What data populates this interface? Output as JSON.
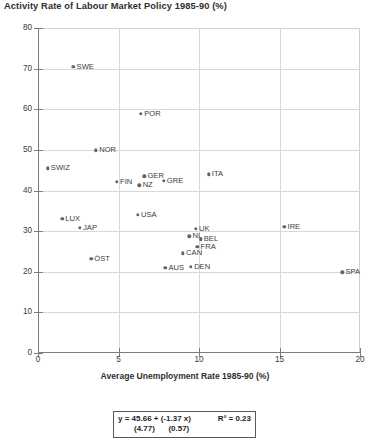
{
  "chart_data": {
    "type": "scatter",
    "title": "Activity Rate of Labour Market Policy 1985-90 (%)",
    "xlabel": "Average Unemployment Rate 1985-90 (%)",
    "ylabel": "",
    "xlim": [
      0,
      20
    ],
    "ylim": [
      0,
      80
    ],
    "xticks": [
      "0",
      "5",
      "10",
      "15",
      "20"
    ],
    "yticks": [
      "0",
      "10",
      "20",
      "30",
      "40",
      "50",
      "60",
      "70",
      "80"
    ],
    "grid": true,
    "legend": "none",
    "point_color": "#646464",
    "points": [
      {
        "label": "SWE",
        "x": 2.2,
        "y": 70.4
      },
      {
        "label": "POR",
        "x": 6.4,
        "y": 58.9
      },
      {
        "label": "NOR",
        "x": 3.6,
        "y": 49.9
      },
      {
        "label": "SWIZ",
        "x": 0.6,
        "y": 45.5
      },
      {
        "label": "ITA",
        "x": 10.6,
        "y": 44.0
      },
      {
        "label": "GER",
        "x": 6.6,
        "y": 43.5
      },
      {
        "label": "GRE",
        "x": 7.8,
        "y": 42.4
      },
      {
        "label": "FIN",
        "x": 4.9,
        "y": 42.2
      },
      {
        "label": "NZ",
        "x": 6.3,
        "y": 41.3
      },
      {
        "label": "USA",
        "x": 6.2,
        "y": 34.0
      },
      {
        "label": "LUX",
        "x": 1.5,
        "y": 33.1
      },
      {
        "label": "UK",
        "x": 9.8,
        "y": 30.6
      },
      {
        "label": "IRE",
        "x": 15.3,
        "y": 31.0
      },
      {
        "label": "JAP",
        "x": 2.6,
        "y": 30.8
      },
      {
        "label": "NL",
        "x": 9.4,
        "y": 28.7
      },
      {
        "label": "BEL",
        "x": 10.1,
        "y": 28.0
      },
      {
        "label": "FRA",
        "x": 9.9,
        "y": 26.2
      },
      {
        "label": "CAN",
        "x": 9.0,
        "y": 24.5
      },
      {
        "label": "OST",
        "x": 3.3,
        "y": 23.2
      },
      {
        "label": "DEN",
        "x": 9.5,
        "y": 21.2
      },
      {
        "label": "AUS",
        "x": 7.9,
        "y": 21.0
      },
      {
        "label": "SPA",
        "x": 18.9,
        "y": 19.9
      }
    ],
    "point_labels": [
      "SWE",
      "POR",
      "NOR",
      "SWIZ",
      "ITA",
      "GER",
      "GRE",
      "FIN",
      "NZ",
      "USA",
      "LUX",
      "UK",
      "IRE",
      "JAP",
      "NL",
      "BEL",
      "FRA",
      "CAN",
      "ÖST",
      "DEN",
      "AUS",
      "SPA"
    ],
    "regression": {
      "equation": "y = 45.66 + (-1.37 x)",
      "r_squared_label": "R² = 0.23",
      "intercept": 45.66,
      "slope": -1.37,
      "r_squared": 0.23,
      "std_error_intercept": "(4.77)",
      "std_error_slope": "(0.57)"
    }
  }
}
